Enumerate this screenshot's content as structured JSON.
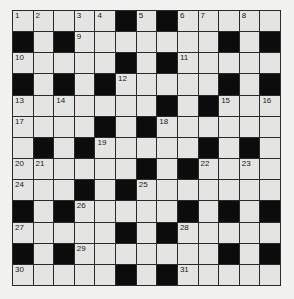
{
  "puzzle": {
    "type": "crossword",
    "rows": 13,
    "cols": 13,
    "colors": {
      "page_background": "#f1f1ef",
      "cell_background": "#e4e4e2",
      "block": "#0c0c0c",
      "grid_line": "#2a2a2a"
    },
    "grid": [
      [
        "1",
        "2",
        "",
        "3",
        "4",
        "#",
        "5",
        "#",
        "6",
        "7",
        "",
        "8",
        ""
      ],
      [
        "#",
        "",
        "#",
        "9",
        "",
        "",
        "",
        "",
        "",
        "",
        "#",
        "",
        "#"
      ],
      [
        "10",
        "",
        "",
        "",
        "",
        "#",
        "",
        "#",
        "11",
        "",
        "",
        "",
        ""
      ],
      [
        "#",
        "",
        "#",
        "",
        "#",
        "12",
        "",
        "",
        "",
        "",
        "#",
        "",
        "#"
      ],
      [
        "13",
        "",
        "14",
        "",
        "",
        "",
        "",
        "#",
        "",
        "#",
        "15",
        "",
        "16"
      ],
      [
        "17",
        "",
        "",
        "",
        "#",
        "",
        "#",
        "18",
        "",
        "",
        "",
        "",
        ""
      ],
      [
        "",
        "#",
        "",
        "#",
        "19",
        "",
        "",
        "",
        "",
        "#",
        "",
        "#",
        ""
      ],
      [
        "20",
        "21",
        "",
        "",
        "",
        "",
        "#",
        "",
        "#",
        "22",
        "",
        "23",
        ""
      ],
      [
        "24",
        "",
        "",
        "#",
        "",
        "#",
        "25",
        "",
        "",
        "",
        "",
        "",
        ""
      ],
      [
        "#",
        "",
        "#",
        "26",
        "",
        "",
        "",
        "",
        "#",
        "",
        "#",
        "",
        "#"
      ],
      [
        "27",
        "",
        "",
        "",
        "",
        "#",
        "",
        "#",
        "28",
        "",
        "",
        "",
        ""
      ],
      [
        "#",
        "",
        "#",
        "29",
        "",
        "",
        "",
        "",
        "",
        "",
        "#",
        "",
        "#"
      ],
      [
        "30",
        "",
        "",
        "",
        "",
        "#",
        "",
        "#",
        "31",
        "",
        "",
        "",
        ""
      ]
    ],
    "clue_numbers": [
      1,
      2,
      3,
      4,
      5,
      6,
      7,
      8,
      9,
      10,
      11,
      12,
      13,
      14,
      15,
      16,
      17,
      18,
      19,
      20,
      21,
      22,
      23,
      24,
      25,
      26,
      27,
      28,
      29,
      30,
      31
    ]
  }
}
